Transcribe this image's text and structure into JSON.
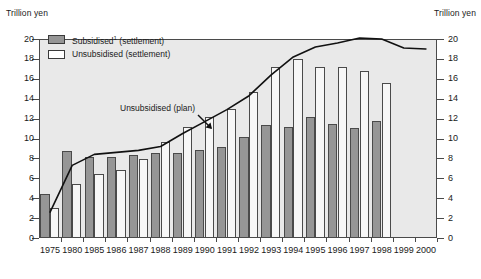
{
  "axis_labels": {
    "left_unit": "Trillion yen",
    "right_unit": "Trillion yen"
  },
  "legend": {
    "items": [
      {
        "label": "Subsidised",
        "footnote": "1",
        "suffix": " (settlement)",
        "swatch": "subsidised",
        "color": "#969696"
      },
      {
        "label": "Unsubsidised",
        "footnote": "",
        "suffix": " (settlement)",
        "swatch": "unsubsidised",
        "color": "#ffffff"
      }
    ]
  },
  "annotation": {
    "plan_label": "Unsubsidised (plan)"
  },
  "colors": {
    "subsidised_fill": "#969696",
    "unsubsidised_fill": "#f7f7f7",
    "plot_background": "#e9e9e9",
    "axis_line": "#4a4a4a",
    "plan_line": "#111111"
  },
  "chart_data": {
    "type": "bar",
    "title": "",
    "subtitle": "",
    "xlabel": "",
    "ylabel": "Trillion yen",
    "ylim": [
      0,
      20
    ],
    "yticks": [
      0,
      2,
      4,
      6,
      8,
      10,
      12,
      14,
      16,
      18,
      20
    ],
    "grid": false,
    "legend_position": "top-left",
    "dual_axis": true,
    "right_ylabel": "Trillion yen",
    "right_ylim": [
      0,
      20
    ],
    "categories": [
      "1975",
      "1980",
      "1985",
      "1986",
      "1987",
      "1988",
      "1989",
      "1990",
      "1991",
      "1992",
      "1993",
      "1994",
      "1995",
      "1996",
      "1997",
      "1998",
      "1999",
      "2000"
    ],
    "series": [
      {
        "name": "Subsidised (settlement)",
        "type": "bar",
        "color": "#969696",
        "values": [
          4.4,
          8.7,
          8.1,
          8.1,
          8.3,
          8.5,
          8.5,
          8.8,
          9.1,
          10.2,
          11.4,
          11.2,
          12.2,
          11.5,
          11.1,
          11.8,
          null,
          null
        ]
      },
      {
        "name": "Unsubsidised (settlement)",
        "type": "bar",
        "color": "#ffffff",
        "values": [
          3.0,
          5.4,
          6.4,
          6.8,
          7.9,
          9.6,
          11.2,
          12.2,
          13.0,
          14.7,
          17.2,
          18.0,
          17.2,
          17.2,
          16.8,
          15.6,
          null,
          null
        ]
      },
      {
        "name": "Unsubsidised (plan)",
        "type": "line",
        "color": "#111111",
        "values": [
          2.6,
          7.3,
          8.4,
          8.6,
          8.8,
          9.2,
          10.5,
          11.7,
          12.9,
          14.3,
          16.4,
          18.2,
          19.2,
          19.6,
          20.1,
          20.0,
          19.1,
          19.0
        ]
      }
    ],
    "bar_extra": {
      "1998_unsubsidised": 14.5
    }
  }
}
